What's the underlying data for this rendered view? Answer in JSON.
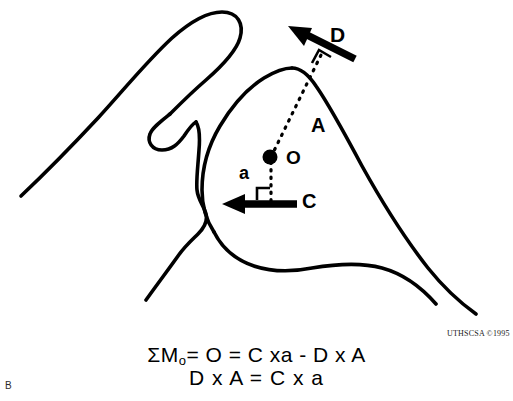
{
  "figure": {
    "panel_label": "B",
    "copyright": "UTHSCSA ©1995",
    "colors": {
      "ink": "#000000",
      "background": "#ffffff"
    }
  },
  "diagram": {
    "labels": {
      "force_deltoid": "D",
      "force_compression": "C",
      "moment_arm_long": "A",
      "moment_arm_short": "a",
      "center_of_rotation": "O"
    },
    "elements": {
      "pivot_point_name": "center-of-rotation-point",
      "dashed_line_long_name": "moment-arm-A-dashed-line",
      "dashed_line_short_name": "moment-arm-a-dashed-line",
      "right_angle_upper_name": "right-angle-marker-D",
      "right_angle_lower_name": "right-angle-marker-C",
      "bone_outline_name": "scapula-humerus-outline"
    }
  },
  "formulas": {
    "line1_prefix": "ΣM",
    "line1_subscript": "o",
    "line1_rest": "= O = C xa - D x A",
    "line2": "D x A = C x a"
  }
}
